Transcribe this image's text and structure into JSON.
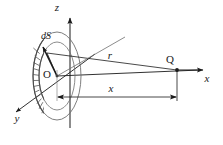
{
  "figure": {
    "type": "physics-vector-diagram"
  },
  "axes": {
    "z": {
      "label": "z",
      "label_x": 57,
      "label_y": 11,
      "direction": "up"
    },
    "x": {
      "label": "x",
      "label_x": 207,
      "label_y": 82,
      "direction": "right"
    },
    "y": {
      "label": "y",
      "label_x": 17,
      "label_y": 122,
      "direction": "down-left"
    }
  },
  "origin": {
    "label": "O",
    "label_x": 47,
    "label_y": 78,
    "point_x": 57,
    "point_y": 76
  },
  "point_q": {
    "label": "Q",
    "label_x": 170,
    "label_y": 63,
    "point_x": 177,
    "point_y": 70
  },
  "vectors": {
    "r": {
      "label": "r",
      "label_x": 110,
      "label_y": 59,
      "from": "element dS",
      "to": "point Q"
    },
    "dS": {
      "label": "dS",
      "label_x": 46,
      "label_y": 39,
      "description": "area element normal vector"
    }
  },
  "dimension": {
    "label": "x",
    "label_x": 111,
    "label_y": 92,
    "from_x": 57,
    "to_x": 177,
    "y": 97
  },
  "disk": {
    "center_x": 57,
    "center_y": 76,
    "rx": 24,
    "ry": 44,
    "ring_rx": 18,
    "ring_ry": 34,
    "ring_segments": 14
  },
  "colors": {
    "line": "#1a1a1a",
    "light_line": "#8a8a8a",
    "background": "#ffffff",
    "hatch": "#555555"
  }
}
